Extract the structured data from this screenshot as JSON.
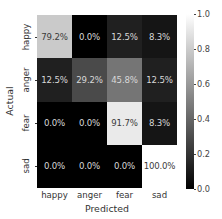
{
  "chart_data": {
    "type": "heatmap",
    "title": "",
    "xlabel": "Predicted",
    "ylabel": "Actual",
    "x_categories": [
      "happy",
      "anger",
      "fear",
      "sad"
    ],
    "y_categories": [
      "happy",
      "anger",
      "fear",
      "sad"
    ],
    "values": [
      [
        0.792,
        0.0,
        0.125,
        0.083
      ],
      [
        0.125,
        0.292,
        0.458,
        0.125
      ],
      [
        0.0,
        0.0,
        0.917,
        0.083
      ],
      [
        0.0,
        0.0,
        0.0,
        1.0
      ]
    ],
    "annotations": [
      [
        "79.2%",
        "0.0%",
        "12.5%",
        "8.3%"
      ],
      [
        "12.5%",
        "29.2%",
        "45.8%",
        "12.5%"
      ],
      [
        "0.0%",
        "0.0%",
        "91.7%",
        "8.3%"
      ],
      [
        "0.0%",
        "0.0%",
        "0.0%",
        "100.0%"
      ]
    ],
    "colormap": "gray",
    "colorbar": {
      "range": [
        0.0,
        1.0
      ],
      "ticks": [
        "1.0",
        "0.8",
        "0.6",
        "0.4",
        "0.2",
        "0.0"
      ],
      "tick_values": [
        1.0,
        0.8,
        0.6,
        0.4,
        0.2,
        0.0
      ]
    }
  }
}
